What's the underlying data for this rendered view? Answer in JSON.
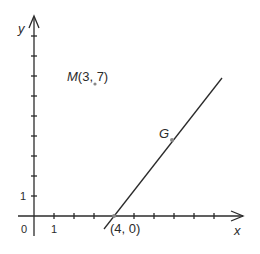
{
  "diagram": {
    "type": "coordinate-plane",
    "axes": {
      "x_label": "x",
      "y_label": "y",
      "origin_label": "0",
      "x_tick_label": "1",
      "y_tick_label": "1",
      "x_ticks": 10,
      "y_ticks": 9
    },
    "points": {
      "M": {
        "label": "M(3, 7)",
        "x": 3,
        "y": 7
      },
      "G": {
        "label": "G"
      },
      "intercept": {
        "label": "(4, 0)",
        "x": 4,
        "y": 0
      }
    },
    "line": {
      "description": "line through (4, 0) and G"
    },
    "colors": {
      "stroke": "#2b2b2b",
      "point": "#888888"
    }
  }
}
